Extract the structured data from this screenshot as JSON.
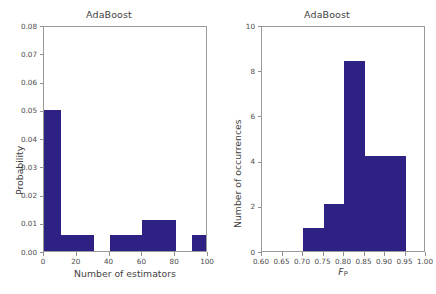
{
  "figure": {
    "background": "#ffffff",
    "bar_color": "#2e2185",
    "axis_color": "#9a9a9a"
  },
  "chart_data": [
    {
      "type": "bar",
      "title": "AdaBoost",
      "xlabel": "Number of estimators",
      "ylabel": "Probability",
      "xlim": [
        0,
        100
      ],
      "ylim": [
        0,
        0.08
      ],
      "grid": false,
      "legend": "none",
      "xticks": [
        0,
        20,
        40,
        60,
        80,
        100
      ],
      "xticklabels": [
        "0",
        "20",
        "40",
        "60",
        "80",
        "100"
      ],
      "yticks": [
        0.0,
        0.01,
        0.02,
        0.03,
        0.04,
        0.05,
        0.06,
        0.07,
        0.08
      ],
      "yticklabels": [
        "0.00",
        "0.01",
        "0.02",
        "0.03",
        "0.04",
        "0.05",
        "0.06",
        "0.07",
        "0.08"
      ],
      "bars": [
        {
          "x0": 0,
          "x1": 10,
          "value": 0.05
        },
        {
          "x0": 10,
          "x1": 20,
          "value": 0.0055
        },
        {
          "x0": 20,
          "x1": 30,
          "value": 0.0055
        },
        {
          "x0": 40,
          "x1": 50,
          "value": 0.0055
        },
        {
          "x0": 50,
          "x1": 60,
          "value": 0.0055
        },
        {
          "x0": 60,
          "x1": 70,
          "value": 0.011
        },
        {
          "x0": 70,
          "x1": 80,
          "value": 0.011
        },
        {
          "x0": 90,
          "x1": 100,
          "value": 0.0055
        }
      ]
    },
    {
      "type": "bar",
      "title": "AdaBoost",
      "xlabel": "F_P",
      "xlabel_base": "F",
      "xlabel_subscript": "P",
      "ylabel": "Number of occurrences",
      "xlim": [
        0.6,
        1.0
      ],
      "ylim": [
        0,
        10
      ],
      "grid": false,
      "legend": "none",
      "xticks": [
        0.6,
        0.65,
        0.7,
        0.75,
        0.8,
        0.85,
        0.9,
        0.95,
        1.0
      ],
      "xticklabels": [
        "0.60",
        "0.65",
        "0.70",
        "0.75",
        "0.80",
        "0.85",
        "0.90",
        "0.95",
        "1.00"
      ],
      "yticks": [
        0,
        2,
        4,
        6,
        8,
        10
      ],
      "yticklabels": [
        "0",
        "2",
        "4",
        "6",
        "8",
        "10"
      ],
      "bars": [
        {
          "x0": 0.7,
          "x1": 0.75,
          "value": 1.0
        },
        {
          "x0": 0.75,
          "x1": 0.8,
          "value": 2.1
        },
        {
          "x0": 0.8,
          "x1": 0.85,
          "value": 8.4
        },
        {
          "x0": 0.85,
          "x1": 0.9,
          "value": 4.2
        },
        {
          "x0": 0.9,
          "x1": 0.95,
          "value": 4.2
        }
      ]
    }
  ],
  "panels": {
    "left": {
      "title": "AdaBoost",
      "xlabel": "Number of estimators",
      "ylabel": "Probability"
    },
    "right": {
      "title": "AdaBoost",
      "ylabel": "Number of occurrences"
    }
  }
}
